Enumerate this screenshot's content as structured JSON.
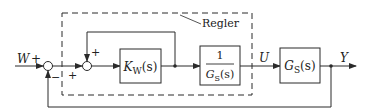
{
  "diagram": {
    "type": "block-diagram",
    "colors": {
      "line": "#2a2a2a",
      "background": "#ffffff"
    },
    "group": {
      "label": "Regler",
      "style": "dashed"
    },
    "signals": {
      "input": "W",
      "input_sign": "+",
      "control": "U",
      "output": "Y"
    },
    "summing_junctions": [
      {
        "id": "sum1",
        "signs": [
          "+",
          "+",
          "−"
        ]
      },
      {
        "id": "sum2",
        "signs": [
          "+",
          "+"
        ]
      }
    ],
    "blocks": [
      {
        "id": "kw",
        "main": "K",
        "sub": "W",
        "arg": "(s)"
      },
      {
        "id": "inv_gs",
        "numerator": "1",
        "main": "G",
        "sub": "S",
        "arg": "(s)"
      },
      {
        "id": "gs",
        "main": "G",
        "sub": "S",
        "arg": "(s)"
      }
    ],
    "sign_labels": {
      "sum1_top_input": "+",
      "sum1_bottom_input": "−",
      "sum2_left_input": "+",
      "sum2_top_input": "+"
    }
  }
}
